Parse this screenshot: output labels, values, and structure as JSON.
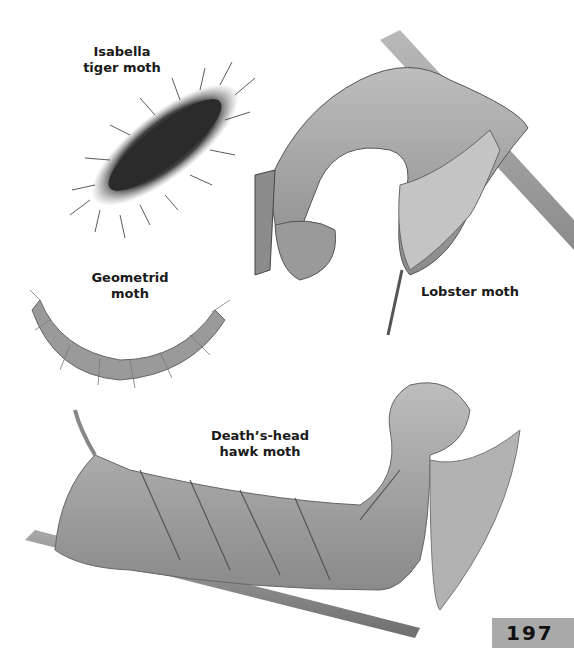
{
  "page": {
    "number": "197",
    "background": "#ffffff",
    "page_tab_color": "#a9a9a9"
  },
  "illustrations": [
    {
      "name": "Isabella tiger moth",
      "label": "Isabella\ntiger moth"
    },
    {
      "name": "Lobster moth",
      "label": "Lobster moth"
    },
    {
      "name": "Geometrid moth",
      "label": "Geometrid\nmoth"
    },
    {
      "name": "Death's-head hawk moth",
      "label": "Death’s-head\nhawk moth"
    }
  ]
}
